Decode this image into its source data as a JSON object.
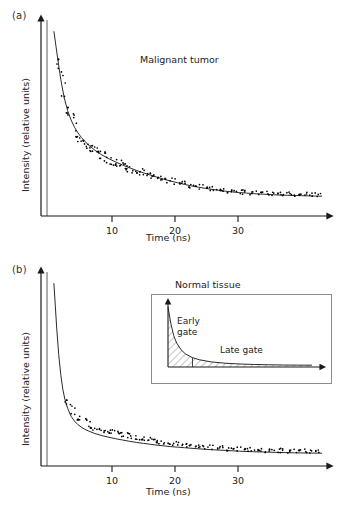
{
  "figure": {
    "panels": [
      {
        "id": "a",
        "label": "(a)",
        "title": "Malignant tumor",
        "xlabel": "Time (ns)",
        "ylabel": "Intensity (relative units)",
        "xticks": [
          10,
          20,
          30
        ],
        "xticklabels": [
          "10",
          "20",
          "30"
        ]
      },
      {
        "id": "b",
        "label": "(b)",
        "title": "Normal tissue",
        "xlabel": "Time (ns)",
        "ylabel": "Intensity (relative units)",
        "xticks": [
          10,
          20,
          30
        ],
        "xticklabels": [
          "10",
          "20",
          "30"
        ],
        "inset": {
          "early_gate_label": "Early\ngate",
          "early_gate_line1": "Early",
          "early_gate_line2": "gate",
          "late_gate_label": "Late gate"
        }
      }
    ]
  },
  "chart_data": [
    {
      "type": "scatter",
      "panel": "a",
      "title": "Malignant tumor",
      "xlabel": "Time (ns)",
      "ylabel": "Intensity (relative units)",
      "xlim": [
        0,
        40
      ],
      "ylim": [
        0,
        1.05
      ],
      "xticks": [
        10,
        20,
        30
      ],
      "yticks": [],
      "grid": false,
      "legend": false,
      "series": [
        {
          "name": "fit curve",
          "kind": "line",
          "model": "bi-exponential decay",
          "description": "Smooth fitted fluorescence decay, fast early component then slow tail",
          "x": [
            1.0,
            1.3,
            1.6,
            2.0,
            2.5,
            3.0,
            3.5,
            4.0,
            4.5,
            5.0,
            6.0,
            7.0,
            8.0,
            9.0,
            10.0,
            11.0,
            12.0,
            13.0,
            14.0,
            15.0,
            16.0,
            17.0,
            18.0,
            19.0,
            20.0,
            21.0,
            22.0,
            23.0,
            24.0,
            25.0,
            26.0,
            27.0,
            28.0,
            29.0,
            30.0,
            31.0,
            32.0,
            33.0,
            34.0,
            35.0,
            36.0,
            37.0,
            38.0,
            39.0,
            40.0
          ],
          "y": [
            1.0,
            0.92,
            0.84,
            0.74,
            0.64,
            0.57,
            0.52,
            0.48,
            0.45,
            0.425,
            0.385,
            0.355,
            0.33,
            0.31,
            0.292,
            0.276,
            0.261,
            0.247,
            0.234,
            0.222,
            0.21,
            0.199,
            0.189,
            0.18,
            0.171,
            0.163,
            0.156,
            0.15,
            0.144,
            0.139,
            0.134,
            0.13,
            0.127,
            0.124,
            0.121,
            0.119,
            0.117,
            0.115,
            0.113,
            0.112,
            0.111,
            0.11,
            0.109,
            0.108,
            0.107
          ]
        },
        {
          "name": "measured data points",
          "kind": "points",
          "description": "Noisy photon-count data points scattered about the fit",
          "x": [
            1.4,
            1.8,
            2.1,
            2.4,
            2.7,
            3.0,
            3.3,
            3.6,
            3.9,
            4.2,
            4.5,
            4.8,
            5.1,
            5.4,
            5.7,
            6.0,
            6.3,
            6.6,
            6.9,
            7.2,
            7.5,
            7.8,
            8.1,
            8.4,
            8.7,
            9.0,
            9.3,
            9.6,
            9.9,
            10.2,
            10.5,
            10.8,
            11.1,
            11.4,
            11.7,
            12.0,
            12.4,
            12.8,
            13.2,
            13.6,
            14.0,
            14.4,
            14.8,
            15.2,
            15.6,
            16.0,
            16.5,
            17.0,
            17.5,
            18.0,
            18.5,
            19.0,
            19.5,
            20.0,
            20.5,
            21.0,
            21.5,
            22.0,
            22.5,
            23.0,
            23.5,
            24.0,
            24.5,
            25.0,
            25.5,
            26.0,
            26.5,
            27.0,
            27.5,
            28.0,
            28.5,
            29.0,
            29.5,
            30.0,
            30.5,
            31.0,
            31.5,
            32.0,
            32.5,
            33.0,
            33.5,
            34.0,
            34.5,
            35.0,
            35.5,
            36.0,
            36.5,
            37.0,
            37.5,
            38.0,
            38.5,
            39.0,
            39.5
          ],
          "y": [
            0.88,
            0.79,
            0.73,
            0.67,
            0.63,
            0.58,
            0.545,
            0.52,
            0.5,
            0.47,
            0.455,
            0.44,
            0.425,
            0.41,
            0.4,
            0.385,
            0.375,
            0.365,
            0.355,
            0.35,
            0.34,
            0.335,
            0.325,
            0.32,
            0.315,
            0.305,
            0.3,
            0.295,
            0.29,
            0.285,
            0.283,
            0.278,
            0.272,
            0.27,
            0.265,
            0.26,
            0.252,
            0.248,
            0.242,
            0.238,
            0.232,
            0.228,
            0.224,
            0.219,
            0.215,
            0.211,
            0.205,
            0.2,
            0.195,
            0.19,
            0.186,
            0.182,
            0.177,
            0.173,
            0.169,
            0.166,
            0.162,
            0.159,
            0.156,
            0.152,
            0.15,
            0.147,
            0.144,
            0.142,
            0.14,
            0.138,
            0.136,
            0.134,
            0.132,
            0.131,
            0.129,
            0.128,
            0.127,
            0.126,
            0.125,
            0.124,
            0.123,
            0.122,
            0.121,
            0.121,
            0.12,
            0.119,
            0.119,
            0.118,
            0.118,
            0.117,
            0.117,
            0.116,
            0.116,
            0.115,
            0.115,
            0.114,
            0.114
          ]
        },
        {
          "name": "excitation pulse marker",
          "kind": "vline",
          "x": 1.0,
          "color": "#9a9a9a"
        }
      ]
    },
    {
      "type": "scatter",
      "panel": "b",
      "title": "Normal tissue",
      "xlabel": "Time (ns)",
      "ylabel": "Intensity (relative units)",
      "xlim": [
        0,
        40
      ],
      "ylim": [
        0,
        1.05
      ],
      "xticks": [
        10,
        20,
        30
      ],
      "yticks": [],
      "grid": false,
      "legend": false,
      "series": [
        {
          "name": "fit curve",
          "kind": "line",
          "model": "bi-exponential decay (faster than malignant)",
          "description": "Smooth fitted fluorescence decay with a sharper initial fall and lower tail",
          "x": [
            1.0,
            1.2,
            1.4,
            1.7,
            2.0,
            2.3,
            2.6,
            3.0,
            3.5,
            4.0,
            4.5,
            5.0,
            5.5,
            6.0,
            7.0,
            8.0,
            9.0,
            10.0,
            11.0,
            12.0,
            13.0,
            14.0,
            15.0,
            16.0,
            17.0,
            18.0,
            19.0,
            20.0,
            22.0,
            24.0,
            26.0,
            28.0,
            30.0,
            32.0,
            34.0,
            36.0,
            38.0,
            40.0
          ],
          "y": [
            1.0,
            0.88,
            0.76,
            0.61,
            0.5,
            0.42,
            0.365,
            0.315,
            0.272,
            0.245,
            0.226,
            0.212,
            0.201,
            0.192,
            0.177,
            0.166,
            0.157,
            0.149,
            0.142,
            0.135,
            0.129,
            0.124,
            0.119,
            0.114,
            0.11,
            0.106,
            0.103,
            0.1,
            0.094,
            0.089,
            0.085,
            0.081,
            0.078,
            0.076,
            0.074,
            0.072,
            0.071,
            0.07
          ]
        },
        {
          "name": "measured data points",
          "kind": "points",
          "description": "Noisy photon-count data points scattered about the fit",
          "x": [
            2.6,
            3.0,
            3.4,
            3.8,
            4.2,
            4.6,
            5.0,
            5.4,
            5.8,
            6.2,
            6.6,
            7.0,
            7.4,
            7.8,
            8.2,
            8.6,
            9.0,
            9.4,
            9.8,
            10.2,
            10.6,
            11.0,
            11.4,
            11.8,
            12.2,
            12.6,
            13.0,
            13.4,
            13.8,
            14.2,
            14.6,
            15.0,
            15.4,
            15.8,
            16.2,
            16.6,
            17.0,
            17.5,
            18.0,
            18.5,
            19.0,
            19.5,
            20.0,
            20.5,
            21.0,
            21.5,
            22.0,
            22.5,
            23.0,
            23.5,
            24.0,
            24.5,
            25.0,
            25.5,
            26.0,
            26.5,
            27.0,
            27.5,
            28.0,
            28.5,
            29.0,
            29.5,
            30.0,
            30.5,
            31.0,
            31.5,
            32.0,
            32.5,
            33.0,
            33.5,
            34.0,
            34.5,
            35.0,
            35.5,
            36.0,
            36.5,
            37.0,
            37.5,
            38.0,
            38.5,
            39.0,
            39.5
          ],
          "y": [
            0.375,
            0.335,
            0.315,
            0.295,
            0.275,
            0.262,
            0.252,
            0.243,
            0.235,
            0.227,
            0.222,
            0.215,
            0.21,
            0.205,
            0.2,
            0.196,
            0.192,
            0.188,
            0.184,
            0.18,
            0.177,
            0.173,
            0.17,
            0.167,
            0.163,
            0.16,
            0.157,
            0.154,
            0.151,
            0.148,
            0.146,
            0.143,
            0.14,
            0.138,
            0.135,
            0.133,
            0.131,
            0.128,
            0.125,
            0.123,
            0.12,
            0.118,
            0.116,
            0.114,
            0.112,
            0.11,
            0.108,
            0.107,
            0.105,
            0.103,
            0.102,
            0.1,
            0.099,
            0.098,
            0.096,
            0.095,
            0.094,
            0.093,
            0.092,
            0.091,
            0.09,
            0.089,
            0.088,
            0.088,
            0.087,
            0.086,
            0.086,
            0.085,
            0.085,
            0.084,
            0.084,
            0.083,
            0.083,
            0.082,
            0.082,
            0.081,
            0.081,
            0.081,
            0.08,
            0.08,
            0.08,
            0.079
          ]
        },
        {
          "name": "excitation pulse marker",
          "kind": "vline",
          "x": 1.0,
          "color": "#9a9a9a"
        }
      ],
      "inset": {
        "type": "area",
        "description": "Schematic decay curve showing two time gates for fluorescence lifetime imaging",
        "regions": [
          {
            "name": "Early gate",
            "hatched": true,
            "x_range": [
              0,
              0.17
            ]
          },
          {
            "name": "Late gate",
            "hatched": true,
            "x_range": [
              0.17,
              1.0
            ]
          }
        ],
        "curve_x": [
          0.0,
          0.02,
          0.04,
          0.06,
          0.09,
          0.12,
          0.17,
          0.22,
          0.3,
          0.4,
          0.5,
          0.6,
          0.7,
          0.8,
          0.9,
          1.0
        ],
        "curve_y": [
          1.0,
          0.72,
          0.52,
          0.4,
          0.29,
          0.22,
          0.155,
          0.12,
          0.085,
          0.062,
          0.05,
          0.042,
          0.037,
          0.033,
          0.031,
          0.03
        ]
      }
    }
  ],
  "style": {
    "axis_color": "#1a1a1a",
    "curve_color": "#2b2b2b",
    "point_color": "#000000",
    "pulse_color": "#9a9a9a",
    "inset_border": "#8c8c8c",
    "hatch_color": "#555555",
    "background": "#ffffff"
  }
}
